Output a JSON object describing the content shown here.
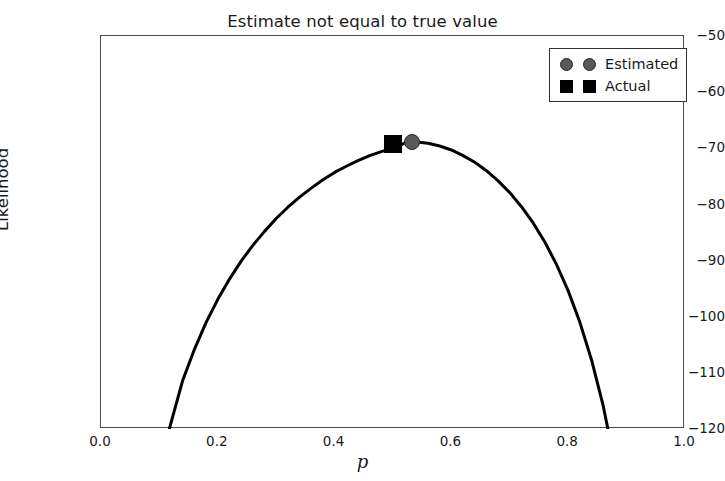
{
  "chart_data": {
    "type": "line",
    "title": "Estimate not equal to true value",
    "xlabel": "p",
    "ylabel": "Likelihood",
    "xlim": [
      0.0,
      1.0
    ],
    "ylim": [
      -120,
      -50
    ],
    "grid": false,
    "legend_position": "upper right",
    "xticks": [
      "0.0",
      "0.2",
      "0.4",
      "0.6",
      "0.8",
      "1.0"
    ],
    "xtick_values": [
      0.0,
      0.2,
      0.4,
      0.6,
      0.8,
      1.0
    ],
    "yticks": [
      "−120",
      "−110",
      "−100",
      "−90",
      "−80",
      "−70",
      "−60",
      "−50"
    ],
    "ytick_values": [
      -120,
      -110,
      -100,
      -90,
      -80,
      -70,
      -60,
      -50
    ],
    "series": [
      {
        "name": "likelihood-curve",
        "type": "line",
        "color": "#000000",
        "linewidth": 3,
        "x": [
          0.1,
          0.117,
          0.14,
          0.16,
          0.18,
          0.2,
          0.22,
          0.24,
          0.26,
          0.28,
          0.3,
          0.32,
          0.34,
          0.36,
          0.38,
          0.4,
          0.42,
          0.44,
          0.46,
          0.48,
          0.5,
          0.52,
          0.53,
          0.54,
          0.56,
          0.58,
          0.6,
          0.62,
          0.64,
          0.66,
          0.68,
          0.7,
          0.72,
          0.74,
          0.76,
          0.78,
          0.8,
          0.82,
          0.84,
          0.86,
          0.88,
          0.9,
          0.915
        ],
        "y": [
          -127.7,
          -120.0,
          -111.3,
          -105.8,
          -101.0,
          -96.9,
          -93.3,
          -90.1,
          -87.3,
          -84.8,
          -82.5,
          -80.5,
          -78.7,
          -77.1,
          -75.6,
          -74.3,
          -73.2,
          -72.2,
          -71.3,
          -70.6,
          -70.0,
          -69.1,
          -68.8,
          -68.9,
          -69.1,
          -69.6,
          -70.3,
          -71.3,
          -72.5,
          -74.0,
          -75.8,
          -77.9,
          -80.4,
          -83.3,
          -86.7,
          -90.7,
          -95.4,
          -101.0,
          -107.7,
          -115.9,
          -126.2,
          -139.5,
          -150.9
        ]
      },
      {
        "name": "Estimated",
        "type": "scatter",
        "marker": "circle",
        "color": "#595959",
        "edge_color": "#262626",
        "x": [
          0.533
        ],
        "y": [
          -68.8
        ]
      },
      {
        "name": "Actual",
        "type": "scatter",
        "marker": "square",
        "color": "#000000",
        "x": [
          0.5
        ],
        "y": [
          -69.2
        ]
      }
    ],
    "legend": [
      {
        "label": "Estimated",
        "marker": "circle",
        "color": "#595959"
      },
      {
        "label": "Actual",
        "marker": "square",
        "color": "#000000"
      }
    ]
  },
  "colors": {
    "background": "#ffffff",
    "axes_edge": "#4d4d4d",
    "text": "#1a1a1a",
    "curve": "#000000",
    "estimated_marker": "#595959",
    "actual_marker": "#000000"
  }
}
